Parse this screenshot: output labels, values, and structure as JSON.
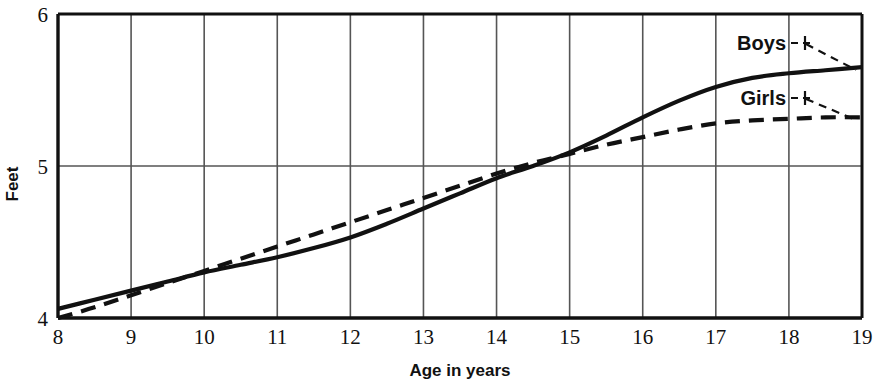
{
  "chart_data": {
    "type": "line",
    "title": "",
    "subtitle": "",
    "xlabel": "Age in years",
    "ylabel": "Feet",
    "xlim": [
      8,
      19
    ],
    "ylim": [
      4,
      6
    ],
    "xticks": [
      "8",
      "9",
      "10",
      "11",
      "12",
      "13",
      "14",
      "15",
      "16",
      "17",
      "18",
      "19"
    ],
    "yticks": [
      "4",
      "5",
      "6"
    ],
    "grid": "vertical gridlines at every year tick; horizontal gridline at 5 ft",
    "legend_position": "inline labels with leader lines at upper right",
    "x": [
      8,
      8.5,
      9,
      9.5,
      10,
      10.5,
      11,
      11.5,
      12,
      12.5,
      13,
      13.5,
      14,
      14.5,
      15,
      15.5,
      16,
      16.5,
      17,
      17.5,
      18,
      18.5,
      19
    ],
    "series": [
      {
        "name": "Boys",
        "style": "solid",
        "color": "#111111",
        "values": [
          4.06,
          4.12,
          4.18,
          4.24,
          4.3,
          4.35,
          4.4,
          4.46,
          4.53,
          4.62,
          4.72,
          4.82,
          4.92,
          5.0,
          5.09,
          5.2,
          5.32,
          5.43,
          5.52,
          5.58,
          5.61,
          5.63,
          5.65
        ]
      },
      {
        "name": "Girls",
        "style": "dashed",
        "color": "#111111",
        "values": [
          4.0,
          4.07,
          4.15,
          4.23,
          4.31,
          4.39,
          4.47,
          4.55,
          4.63,
          4.71,
          4.79,
          4.87,
          4.95,
          5.02,
          5.08,
          5.14,
          5.19,
          5.24,
          5.28,
          5.3,
          5.31,
          5.32,
          5.32
        ]
      }
    ],
    "annotations": [
      {
        "text": "Boys",
        "target_series": "Boys",
        "leader": "dashed leader line from label to the solid Boys curve"
      },
      {
        "text": "Girls",
        "target_series": "Girls",
        "leader": "dashed leader line from label to the dashed Girls curve"
      }
    ]
  }
}
